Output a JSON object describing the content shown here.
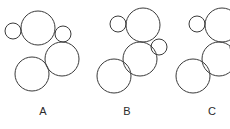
{
  "figure": {
    "width": 230,
    "height": 129,
    "background_color": "#ffffff",
    "stroke_color": "#3a3a3a",
    "stroke_width": 1
  },
  "groups": [
    {
      "id": "a",
      "label": "A",
      "label_x": 43,
      "label_y": 114,
      "clipped": false,
      "circles": [
        {
          "name": "small-upper-left",
          "cx": 13,
          "cy": 31,
          "r": 8
        },
        {
          "name": "large-upper",
          "cx": 38,
          "cy": 28,
          "r": 17
        },
        {
          "name": "small-right",
          "cx": 63,
          "cy": 34,
          "r": 8
        },
        {
          "name": "medium-right",
          "cx": 62,
          "cy": 59,
          "r": 17
        },
        {
          "name": "medium-lower-left",
          "cx": 32,
          "cy": 74,
          "r": 17
        }
      ]
    },
    {
      "id": "b",
      "label": "B",
      "label_x": 127,
      "label_y": 114,
      "clipped": false,
      "circles": [
        {
          "name": "small-upper-left",
          "cx": 118,
          "cy": 24,
          "r": 8
        },
        {
          "name": "large-upper",
          "cx": 143,
          "cy": 25,
          "r": 17
        },
        {
          "name": "small-right",
          "cx": 159,
          "cy": 47,
          "r": 8
        },
        {
          "name": "medium-middle",
          "cx": 140,
          "cy": 59,
          "r": 17
        },
        {
          "name": "medium-lower-left",
          "cx": 114,
          "cy": 76,
          "r": 17
        }
      ]
    },
    {
      "id": "c",
      "label": "C",
      "label_x": 212,
      "label_y": 114,
      "clipped": true,
      "circles": [
        {
          "name": "small-upper-left",
          "cx": 197,
          "cy": 24,
          "r": 8
        },
        {
          "name": "large-upper",
          "cx": 222,
          "cy": 25,
          "r": 17
        },
        {
          "name": "small-right",
          "cx": 238,
          "cy": 47,
          "r": 8
        },
        {
          "name": "medium-middle",
          "cx": 219,
          "cy": 59,
          "r": 17
        },
        {
          "name": "medium-lower-left",
          "cx": 193,
          "cy": 76,
          "r": 17
        }
      ]
    }
  ]
}
